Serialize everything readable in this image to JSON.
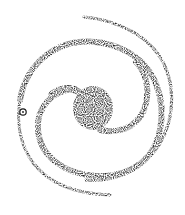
{
  "figure": {
    "title": "Spiral galaxy schematic",
    "ink_color": "#1a1a1a",
    "background": "#ffffff",
    "sun_marker": {
      "symbol": "⊙",
      "label": "Sun",
      "x": 23,
      "y": 112
    }
  }
}
